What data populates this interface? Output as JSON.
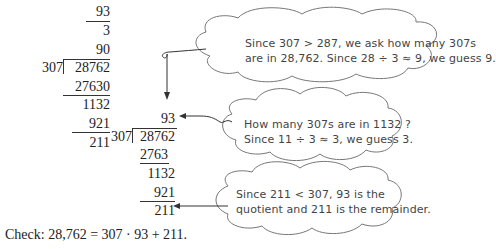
{
  "left_division": {
    "partial_quotients": [
      "93",
      "3",
      "90"
    ],
    "divisor": "307",
    "dividend": "28762",
    "steps": [
      "27630",
      "1132",
      "921",
      "211"
    ]
  },
  "right_division": {
    "quotient": "93",
    "divisor": "307",
    "dividend": "28762",
    "steps": [
      "2763",
      "1132",
      "921",
      "211"
    ]
  },
  "bubbles": [
    {
      "line1": "Since 307 > 287, we ask how many 307s",
      "line2": "are in 28,762.  Since 28 ÷ 3 ≈ 9, we guess 9."
    },
    {
      "line1": "How many 307s are in 1132 ?",
      "line2": "Since 11 ÷ 3 ≈ 3, we guess 3."
    },
    {
      "line1": "Since 211 < 307, 93 is the",
      "line2": "quotient and 211 is the remainder."
    }
  ],
  "check": "Check: 28,762 = 307 · 93 + 211."
}
